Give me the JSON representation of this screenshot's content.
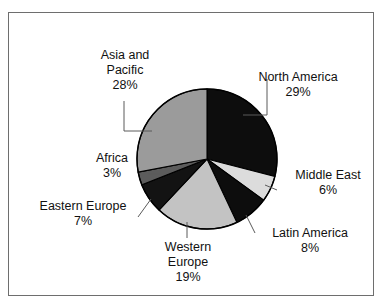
{
  "chart_data": {
    "type": "pie",
    "title": "",
    "subtitle": "",
    "xlabel": "",
    "ylabel": "",
    "legend_position": "none",
    "grid": false,
    "units": "percent",
    "start_angle_deg": 0,
    "direction": "clockwise",
    "categories": [
      "North America",
      "Middle East",
      "Latin America",
      "Western Europe",
      "Eastern Europe",
      "Africa",
      "Asia and Pacific"
    ],
    "values": [
      29,
      6,
      8,
      19,
      7,
      3,
      28
    ],
    "slices": [
      {
        "name": "North America",
        "label_lines": [
          "North America",
          "29%"
        ],
        "value": 29,
        "value_text": "29%",
        "color": "#0d0d0d",
        "start_deg": 0,
        "end_deg": 104.4
      },
      {
        "name": "Middle East",
        "label_lines": [
          "Middle East",
          "6%"
        ],
        "value": 6,
        "value_text": "6%",
        "color": "#dcdcdc",
        "start_deg": 104.4,
        "end_deg": 126.0
      },
      {
        "name": "Latin America",
        "label_lines": [
          "Latin America",
          "8%"
        ],
        "value": 8,
        "value_text": "8%",
        "color": "#0d0d0d",
        "start_deg": 126.0,
        "end_deg": 154.8
      },
      {
        "name": "Western Europe",
        "label_lines": [
          "Western",
          "Europe",
          "19%"
        ],
        "value": 19,
        "value_text": "19%",
        "color": "#c3c3c3",
        "start_deg": 154.8,
        "end_deg": 223.2
      },
      {
        "name": "Eastern Europe",
        "label_lines": [
          "Eastern Europe",
          "7%"
        ],
        "value": 7,
        "value_text": "7%",
        "color": "#131313",
        "start_deg": 223.2,
        "end_deg": 248.4
      },
      {
        "name": "Africa",
        "label_lines": [
          "Africa",
          "3%"
        ],
        "value": 3,
        "value_text": "3%",
        "color": "#5c5c5c",
        "start_deg": 248.4,
        "end_deg": 259.2
      },
      {
        "name": "Asia and Pacific",
        "label_lines": [
          "Asia and",
          "Pacific",
          "28%"
        ],
        "value": 28,
        "value_text": "28%",
        "color": "#9b9b9b",
        "start_deg": 259.2,
        "end_deg": 360.0
      }
    ]
  },
  "labels": {
    "north_america": {
      "line1": "North America",
      "line2": "29%"
    },
    "middle_east": {
      "line1": "Middle East",
      "line2": "6%"
    },
    "latin_america": {
      "line1": "Latin America",
      "line2": "8%"
    },
    "western_europe": {
      "line1": "Western",
      "line2": "Europe",
      "line3": "19%"
    },
    "eastern_europe": {
      "line1": "Eastern Europe",
      "line2": "7%"
    },
    "africa": {
      "line1": "Africa",
      "line2": "3%"
    },
    "asia_pacific": {
      "line1": "Asia and",
      "line2": "Pacific",
      "line3": "28%"
    }
  },
  "style": {
    "frame_border_color": "#6e6e6e",
    "pie_outline_color": "#000000",
    "leader_line_color": "#5a5a5a",
    "background": "#ffffff",
    "text_color": "#111111"
  }
}
